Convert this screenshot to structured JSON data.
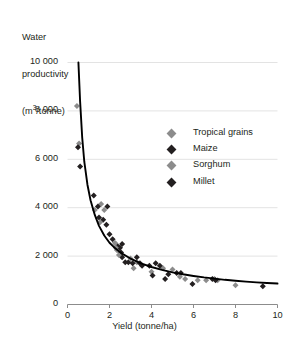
{
  "chart_data": {
    "type": "scatter",
    "title": "",
    "ylabel_lines": [
      "Water",
      "productivity",
      "(m³/tonne)"
    ],
    "ylabel": "Water productivity (m3/tonne)",
    "xlabel": "Yield (tonne/ha)",
    "xlim": [
      0,
      10
    ],
    "ylim": [
      0,
      10000
    ],
    "xticks": [
      0,
      2,
      4,
      6,
      8,
      10
    ],
    "xtick_labels": [
      "0",
      "2",
      "4",
      "6",
      "8",
      "10"
    ],
    "yticks": [
      0,
      2000,
      4000,
      6000,
      8000,
      10000
    ],
    "ytick_labels": [
      "0",
      "2 000",
      "4 000",
      "6 000",
      "8 000",
      "10 000"
    ],
    "grid": "horizontal",
    "legend_position": "center-right",
    "colors": {
      "light_marker": "#8c8c8c",
      "dark_marker": "#231f20",
      "curve": "#000000",
      "gridline": "#e3e3e3",
      "axis": "#8c8c8c",
      "text": "#231f20",
      "background": "#ffffff"
    },
    "series": [
      {
        "name": "Tropical grains",
        "marker": "diamond",
        "color": "#8c8c8c",
        "points": [
          [
            0.45,
            8200
          ],
          [
            0.55,
            6650
          ],
          [
            1.6,
            4150
          ],
          [
            1.75,
            3900
          ],
          [
            2.3,
            2500
          ],
          [
            2.35,
            2250
          ],
          [
            2.45,
            2200
          ],
          [
            3.3,
            1750
          ],
          [
            4.55,
            1500
          ],
          [
            5.0,
            1450
          ],
          [
            5.6,
            1050
          ],
          [
            6.2,
            1000
          ],
          [
            6.6,
            1000
          ],
          [
            7.0,
            1050
          ],
          [
            7.15,
            1000
          ],
          [
            8.0,
            800
          ]
        ]
      },
      {
        "name": "Maize",
        "marker": "diamond",
        "color": "#231f20",
        "points": [
          [
            0.5,
            6500
          ],
          [
            0.6,
            5700
          ],
          [
            1.25,
            4500
          ],
          [
            1.45,
            4050
          ],
          [
            1.5,
            3600
          ],
          [
            1.7,
            3500
          ],
          [
            1.85,
            3300
          ],
          [
            2.0,
            2900
          ],
          [
            2.15,
            2700
          ],
          [
            2.4,
            2400
          ],
          [
            2.5,
            2350
          ],
          [
            2.55,
            2150
          ],
          [
            2.6,
            1950
          ],
          [
            2.9,
            1750
          ],
          [
            3.3,
            1950
          ],
          [
            3.45,
            1700
          ],
          [
            3.55,
            1600
          ],
          [
            3.9,
            1600
          ],
          [
            4.2,
            1700
          ],
          [
            4.4,
            1600
          ],
          [
            4.8,
            1250
          ],
          [
            5.2,
            1300
          ],
          [
            5.4,
            1300
          ],
          [
            6.9,
            1050
          ],
          [
            7.05,
            1000
          ],
          [
            9.3,
            750
          ]
        ]
      },
      {
        "name": "Sorghum",
        "marker": "diamond",
        "color": "#8c8c8c",
        "points": [
          [
            1.3,
            3900
          ],
          [
            1.55,
            3400
          ],
          [
            2.25,
            2550
          ],
          [
            2.3,
            2350
          ],
          [
            2.45,
            2050
          ],
          [
            3.0,
            1900
          ],
          [
            3.15,
            1500
          ],
          [
            4.0,
            1350
          ],
          [
            5.35,
            1150
          ]
        ]
      },
      {
        "name": "Millet",
        "marker": "diamond",
        "color": "#231f20",
        "points": [
          [
            1.9,
            4050
          ],
          [
            2.6,
            2500
          ],
          [
            2.75,
            1750
          ],
          [
            3.1,
            1700
          ],
          [
            4.05,
            1200
          ],
          [
            4.65,
            1050
          ],
          [
            5.95,
            850
          ]
        ]
      }
    ],
    "fit_curve": {
      "description": "decaying power-law trend line",
      "points": [
        [
          0.52,
          10000
        ],
        [
          0.6,
          8400
        ],
        [
          0.7,
          6900
        ],
        [
          0.8,
          5900
        ],
        [
          0.95,
          4950
        ],
        [
          1.1,
          4300
        ],
        [
          1.3,
          3700
        ],
        [
          1.5,
          3250
        ],
        [
          1.75,
          2850
        ],
        [
          2.0,
          2550
        ],
        [
          2.3,
          2300
        ],
        [
          2.6,
          2100
        ],
        [
          3.0,
          1900
        ],
        [
          3.5,
          1700
        ],
        [
          4.0,
          1550
        ],
        [
          4.5,
          1430
        ],
        [
          5.0,
          1330
        ],
        [
          5.5,
          1250
        ],
        [
          6.0,
          1180
        ],
        [
          6.5,
          1120
        ],
        [
          7.0,
          1070
        ],
        [
          7.5,
          1020
        ],
        [
          8.0,
          980
        ],
        [
          8.5,
          945
        ],
        [
          9.0,
          915
        ],
        [
          9.5,
          890
        ],
        [
          10.0,
          865
        ]
      ]
    },
    "legend": [
      {
        "label": "Tropical grains",
        "color": "#8c8c8c"
      },
      {
        "label": "Maize",
        "color": "#231f20"
      },
      {
        "label": "Sorghum",
        "color": "#8c8c8c"
      },
      {
        "label": "Millet",
        "color": "#231f20"
      }
    ]
  }
}
